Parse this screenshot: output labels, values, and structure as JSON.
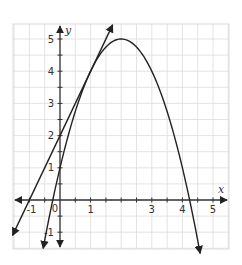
{
  "chart_data": {
    "type": "line",
    "title": "",
    "xlabel": "x",
    "ylabel": "y",
    "xlim": [
      -1.5,
      5.5
    ],
    "ylim": [
      -1.5,
      5.5
    ],
    "grid": true,
    "grid_step": 0.5,
    "x_ticks": [
      "-1",
      "0",
      "1",
      "2",
      "3",
      "4",
      "5"
    ],
    "y_ticks": [
      "-1",
      "1",
      "2",
      "3",
      "4",
      "5"
    ],
    "series": [
      {
        "name": "parabola",
        "equation": "y = -(x-2)^2 + 5",
        "vertex": [
          2,
          5
        ],
        "x_intercepts": [
          -0.24,
          4.24
        ],
        "y_intercept": 1,
        "x": [
          -0.3,
          0,
          0.5,
          1,
          1.5,
          2,
          2.5,
          3,
          3.5,
          4,
          4.5
        ],
        "values": [
          -0.29,
          1,
          2.75,
          4,
          4.75,
          5,
          4.75,
          4,
          2.75,
          1,
          -1.25
        ]
      },
      {
        "name": "tangent line",
        "equation": "y = 2x + 2",
        "x_intercept": -1,
        "y_intercept": 2,
        "tangent_point": [
          1,
          4
        ],
        "x": [
          -1.6,
          -1,
          0,
          1,
          1.7
        ],
        "values": [
          -1.2,
          0,
          2,
          4,
          5.4
        ]
      }
    ]
  },
  "axes": {
    "x_label": "x",
    "y_label": "y",
    "origin_label": "0"
  },
  "colors": {
    "curve": "#222222",
    "grid": "#dcdcdc",
    "axis": "#333333"
  }
}
